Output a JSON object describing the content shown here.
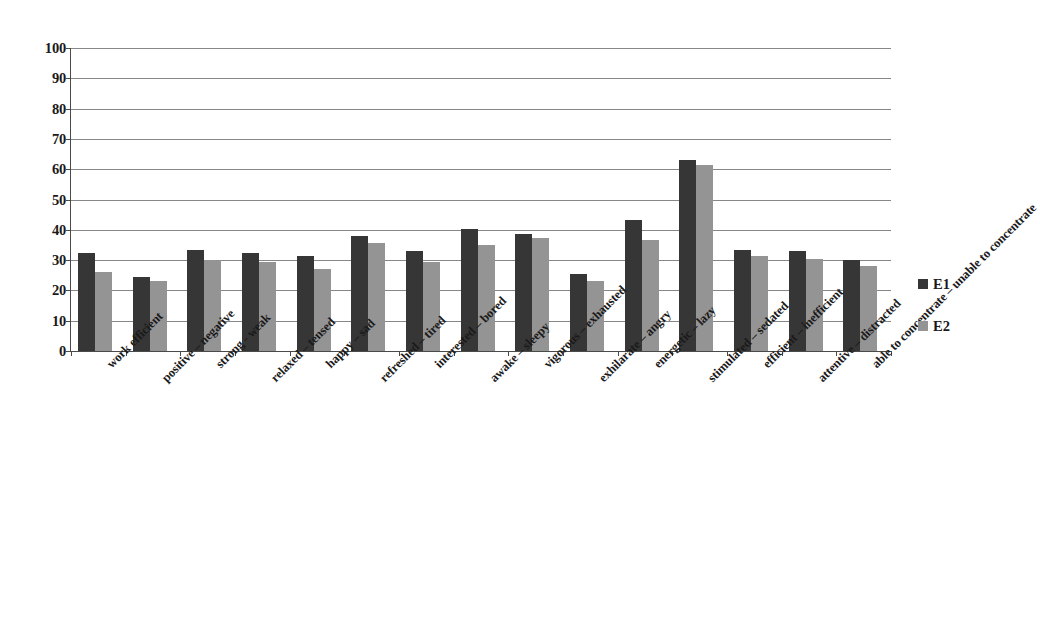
{
  "chart_data": {
    "type": "bar",
    "title": "",
    "subtitle": "",
    "xlabel": "",
    "ylabel": "",
    "ylim": [
      0,
      100
    ],
    "ytick_step": 10,
    "yticks": [
      100,
      90,
      80,
      70,
      60,
      50,
      40,
      30,
      20,
      10,
      0
    ],
    "grid": true,
    "legend_position": "right",
    "categories": [
      "work efficient",
      "positive – negative",
      "strong - weak",
      "relaxed – tensed",
      "happy – sad",
      "refreshed – tired",
      "interested – bored",
      "awake – sleepy",
      "vigorous – exhausted",
      "exhilarate – angry",
      "energetic – lazy",
      "stimulated – sedated",
      "efficient – inefficient",
      "attentive – distracted",
      "able to concentrate – unable to concentrate"
    ],
    "series": [
      {
        "name": "E1",
        "color": "#363636",
        "values": [
          32.5,
          24.5,
          33.5,
          32.2,
          31.5,
          37.8,
          33.0,
          40.3,
          38.5,
          25.5,
          43.3,
          63.0,
          33.3,
          33.0,
          30.0
        ]
      },
      {
        "name": "E2",
        "color": "#949494",
        "values": [
          26.0,
          23.0,
          30.0,
          29.5,
          27.0,
          35.8,
          29.3,
          35.0,
          37.3,
          23.0,
          36.5,
          61.5,
          31.5,
          30.5,
          28.0
        ]
      }
    ]
  },
  "legend": {
    "items": [
      {
        "label": "E1",
        "color": "#363636"
      },
      {
        "label": "E2",
        "color": "#949494"
      }
    ]
  },
  "axis": {
    "line_color": "#4a4a4a",
    "grid_color": "#878787"
  }
}
